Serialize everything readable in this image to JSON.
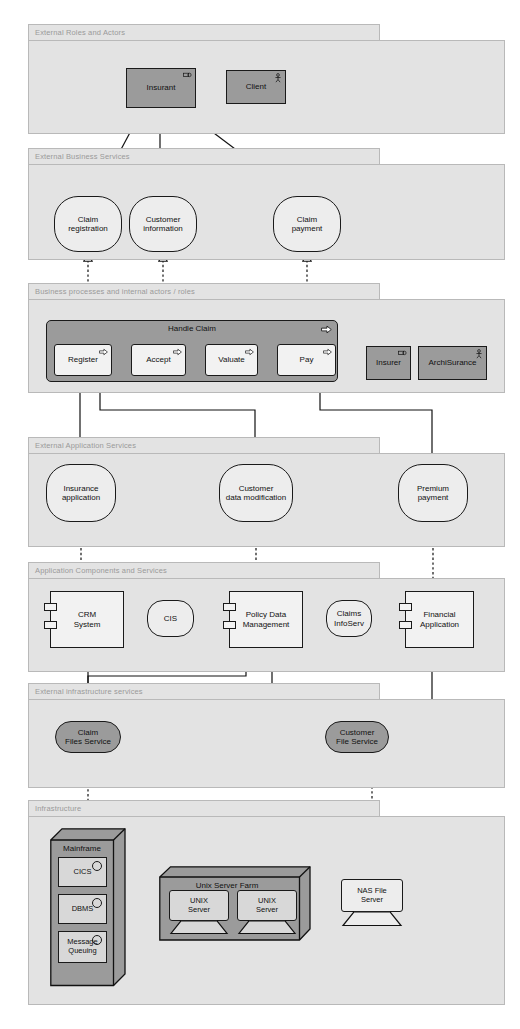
{
  "diagram": {
    "colors": {
      "layer_fill": "#e3e3e3",
      "layer_border": "#b9b9b9",
      "layer_label": "#9a9a9a",
      "element_light": "#f2f2f2",
      "element_dark": "#9b9b9b",
      "device_fill": "#d8d8d8",
      "stroke": "#1a1a1a"
    }
  },
  "layers": [
    {
      "id": "roles",
      "label": "External Roles and Actors"
    },
    {
      "id": "bizservices",
      "label": "External Business Services"
    },
    {
      "id": "bizprocess",
      "label": "Business processes and internal actors / roles"
    },
    {
      "id": "appservices",
      "label": "External Application Services"
    },
    {
      "id": "appcomponents",
      "label": "Application Components and Services"
    },
    {
      "id": "infraservices",
      "label": "External infrastructure services"
    },
    {
      "id": "infra",
      "label": "Infrastructure"
    }
  ],
  "roles_layer": {
    "elements": [
      {
        "id": "insurant",
        "label": "Insurant",
        "icon": "business-role-icon",
        "style": "dark"
      },
      {
        "id": "client",
        "label": "Client",
        "icon": "business-actor-icon",
        "style": "dark"
      }
    ]
  },
  "business_services": {
    "elements": [
      {
        "id": "claim-registration",
        "label": "Claim\nregistration"
      },
      {
        "id": "customer-information",
        "label": "Customer\ninformation"
      },
      {
        "id": "claim-payment",
        "label": "Claim\npayment"
      }
    ]
  },
  "business_process": {
    "group": {
      "id": "handle-claim",
      "label": "Handle Claim",
      "icon": "process-arrow-icon"
    },
    "steps": [
      {
        "id": "register",
        "label": "Register",
        "icon": "process-arrow-icon"
      },
      {
        "id": "accept",
        "label": "Accept",
        "icon": "process-arrow-icon"
      },
      {
        "id": "valuate",
        "label": "Valuate",
        "icon": "process-arrow-icon"
      },
      {
        "id": "pay",
        "label": "Pay",
        "icon": "process-arrow-icon"
      }
    ],
    "actors": [
      {
        "id": "insurer",
        "label": "Insurer",
        "icon": "business-role-icon"
      },
      {
        "id": "archisurance",
        "label": "ArchiSurance",
        "icon": "business-actor-icon"
      }
    ]
  },
  "application_services": {
    "elements": [
      {
        "id": "insurance-application",
        "label": "Insurance\napplication"
      },
      {
        "id": "customer-data-modification",
        "label": "Customer\ndata modification"
      },
      {
        "id": "premium-payment",
        "label": "Premium\npayment"
      }
    ]
  },
  "application_components": {
    "components": [
      {
        "id": "crm-system",
        "label": "CRM\nSystem"
      },
      {
        "id": "policy-data-management",
        "label": "Policy Data\nManagement"
      },
      {
        "id": "financial-application",
        "label": "Financial\nApplication"
      }
    ],
    "interfaces": [
      {
        "id": "cis",
        "label": "CIS"
      },
      {
        "id": "claims-infoserv",
        "label": "Claims\nInfoServ"
      }
    ]
  },
  "infrastructure_services": {
    "elements": [
      {
        "id": "claim-files-service",
        "label": "Claim\nFiles Service"
      },
      {
        "id": "customer-file-service",
        "label": "Customer\nFile Service"
      }
    ]
  },
  "infrastructure": {
    "mainframe": {
      "id": "mainframe",
      "label": "Mainframe",
      "software": [
        {
          "id": "cics",
          "label": "CICS",
          "icon": "system-software-icon"
        },
        {
          "id": "dbms",
          "label": "DBMS",
          "icon": "system-software-icon"
        },
        {
          "id": "message-queuing",
          "label": "Message\nQueuing",
          "icon": "system-software-icon"
        }
      ]
    },
    "unix_farm": {
      "id": "unix-server-farm",
      "label": "Unix Server Farm",
      "devices": [
        {
          "id": "unix-server-1",
          "label": "UNIX\nServer"
        },
        {
          "id": "unix-server-2",
          "label": "UNIX\nServer"
        }
      ]
    },
    "nas": {
      "id": "nas-file-server",
      "label": "NAS File\nServer"
    }
  }
}
